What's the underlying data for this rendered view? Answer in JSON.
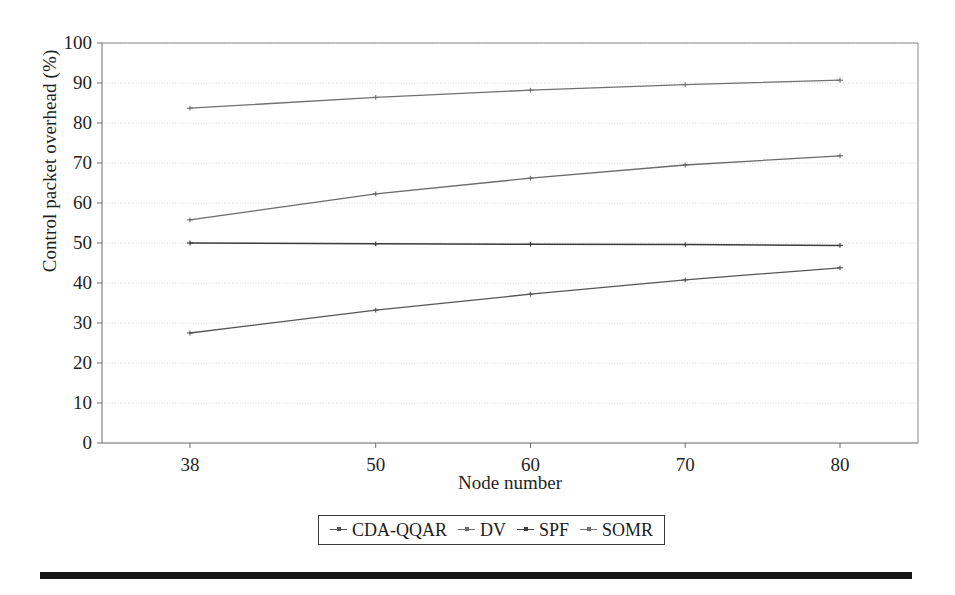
{
  "chart_data": {
    "type": "line",
    "title": "",
    "xlabel": "Node number",
    "ylabel": "Control packet overhead (%)",
    "x": [
      38,
      50,
      60,
      70,
      80
    ],
    "categories": [
      "38",
      "50",
      "60",
      "70",
      "80"
    ],
    "xtick_labels": [
      "38",
      "50",
      "60",
      "70",
      "80"
    ],
    "ytick_labels": [
      "0",
      "10",
      "20",
      "30",
      "40",
      "50",
      "60",
      "70",
      "80",
      "90",
      "100"
    ],
    "ytick_values": [
      0,
      10,
      20,
      30,
      40,
      50,
      60,
      70,
      80,
      90,
      100
    ],
    "ylim": [
      0,
      100
    ],
    "xlim": [
      32,
      85
    ],
    "grid": true,
    "grid_axis": "y",
    "legend_position": "bottom-center",
    "series": [
      {
        "name": "CDA-QQAR",
        "color": "#555555",
        "values": [
          27.5,
          33.2,
          37.2,
          40.8,
          43.8
        ]
      },
      {
        "name": "DV",
        "color": "#6a6a6a",
        "values": [
          55.8,
          62.3,
          66.2,
          69.5,
          71.8
        ]
      },
      {
        "name": "SPF",
        "color": "#3d3d3d",
        "values": [
          50.0,
          49.8,
          49.7,
          49.6,
          49.4
        ]
      },
      {
        "name": "SOMR",
        "color": "#707070",
        "values": [
          83.7,
          86.4,
          88.2,
          89.6,
          90.7
        ]
      }
    ]
  },
  "axes": {
    "y_title": "Control packet overhead (%)",
    "x_title": "Node number"
  },
  "legend": {
    "entries": [
      {
        "label": "CDA-QQAR"
      },
      {
        "label": "DV"
      },
      {
        "label": "SPF"
      },
      {
        "label": "SOMR"
      }
    ]
  },
  "colors": {
    "axis": "#6f6f6f",
    "grid": "#bdbdbd",
    "text": "#1f1f1f",
    "rule": "#161616"
  }
}
